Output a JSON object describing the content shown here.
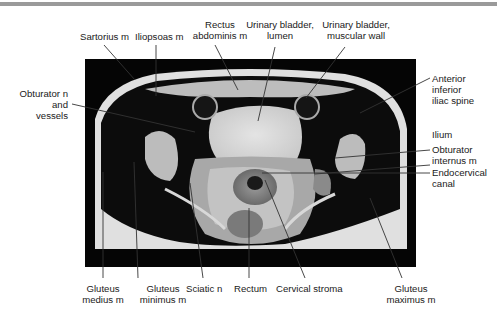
{
  "figure": {
    "labels": {
      "sartorius": "Sartorius m",
      "iliopsoas": "Iliopsoas m",
      "rectus_1": "Rectus",
      "rectus_2": "abdominis m",
      "bladder_lumen_1": "Urinary bladder,",
      "bladder_lumen_2": "lumen",
      "bladder_wall_1": "Urinary bladder,",
      "bladder_wall_2": "muscular wall",
      "obturator_n_1": "Obturator n",
      "obturator_n_2": "and",
      "obturator_n_3": "vessels",
      "aiis_1": "Anterior",
      "aiis_2": "inferior",
      "aiis_3": "iliac spine",
      "ilium": "Ilium",
      "obturator_int_1": "Obturator",
      "obturator_int_2": "internus m",
      "endocervical_1": "Endocervical",
      "endocervical_2": "canal",
      "gluteus_medius_1": "Gluteus",
      "gluteus_medius_2": "medius m",
      "gluteus_minimus_1": "Gluteus",
      "gluteus_minimus_2": "minimus m",
      "sciatic": "Sciatic n",
      "rectum": "Rectum",
      "cervical_stroma": "Cervical stroma",
      "gluteus_maximus_1": "Gluteus",
      "gluteus_maximus_2": "maximus m"
    }
  }
}
